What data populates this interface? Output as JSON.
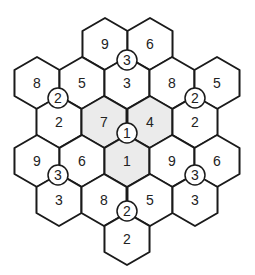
{
  "puzzle": {
    "hex_radius": 26,
    "colors": {
      "line": "#1a1a1a",
      "fill": "#ffffff",
      "shaded": "#ebebeb",
      "text": "#222222"
    },
    "cells": [
      {
        "x": 105,
        "y": 44,
        "value": "9",
        "shaded": false
      },
      {
        "x": 150,
        "y": 44,
        "value": "6",
        "shaded": false
      },
      {
        "x": 37,
        "y": 83,
        "value": "8",
        "shaded": false
      },
      {
        "x": 82,
        "y": 83,
        "value": "5",
        "shaded": false
      },
      {
        "x": 127,
        "y": 83,
        "value": "3",
        "shaded": false
      },
      {
        "x": 172,
        "y": 83,
        "value": "8",
        "shaded": false
      },
      {
        "x": 217,
        "y": 83,
        "value": "5",
        "shaded": false
      },
      {
        "x": 59,
        "y": 122,
        "value": "2",
        "shaded": false
      },
      {
        "x": 104,
        "y": 122,
        "value": "7",
        "shaded": true
      },
      {
        "x": 150,
        "y": 122,
        "value": "4",
        "shaded": true
      },
      {
        "x": 195,
        "y": 122,
        "value": "2",
        "shaded": false
      },
      {
        "x": 37,
        "y": 161,
        "value": "9",
        "shaded": false
      },
      {
        "x": 82,
        "y": 161,
        "value": "6",
        "shaded": false
      },
      {
        "x": 127,
        "y": 161,
        "value": "1",
        "shaded": true
      },
      {
        "x": 172,
        "y": 161,
        "value": "9",
        "shaded": false
      },
      {
        "x": 217,
        "y": 161,
        "value": "6",
        "shaded": false
      },
      {
        "x": 59,
        "y": 200,
        "value": "3",
        "shaded": false
      },
      {
        "x": 104,
        "y": 200,
        "value": "8",
        "shaded": false
      },
      {
        "x": 150,
        "y": 200,
        "value": "5",
        "shaded": false
      },
      {
        "x": 195,
        "y": 200,
        "value": "3",
        "shaded": false
      },
      {
        "x": 127,
        "y": 239,
        "value": "2",
        "shaded": false
      }
    ],
    "circles": [
      {
        "x": 127,
        "y": 60,
        "value": "3"
      },
      {
        "x": 58,
        "y": 98,
        "value": "2"
      },
      {
        "x": 195,
        "y": 98,
        "value": "2"
      },
      {
        "x": 127,
        "y": 133,
        "value": "1"
      },
      {
        "x": 58,
        "y": 175,
        "value": "3"
      },
      {
        "x": 195,
        "y": 175,
        "value": "3"
      },
      {
        "x": 127,
        "y": 211,
        "value": "2"
      }
    ]
  }
}
